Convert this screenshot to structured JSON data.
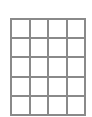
{
  "grid": {
    "columns": 4,
    "rows": 5,
    "line_color": "#8a8a8a",
    "cell_color": "#ffffff"
  }
}
